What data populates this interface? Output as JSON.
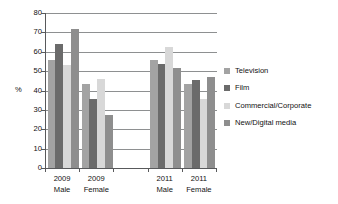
{
  "chart_data": {
    "type": "bar",
    "title": "",
    "xlabel": "",
    "ylabel": "%",
    "ylim": [
      0,
      80
    ],
    "yticks": [
      0,
      10,
      20,
      30,
      40,
      50,
      60,
      70,
      80
    ],
    "grid": true,
    "legend_position": "right",
    "categories": [
      "2009 Male",
      "2009 Female",
      "",
      "2011 Male",
      "2011 Female"
    ],
    "category_lines": [
      [
        "2009",
        "Male"
      ],
      [
        "2009",
        "Female"
      ],
      [
        "",
        ""
      ],
      [
        "2011",
        "Male"
      ],
      [
        "2011",
        "Female"
      ]
    ],
    "series": [
      {
        "name": "Television",
        "color": "#a3a3a3",
        "values": [
          56,
          43.5,
          null,
          55.5,
          43.5
        ]
      },
      {
        "name": "Film",
        "color": "#6b6b6b",
        "values": [
          64,
          35.5,
          null,
          53.5,
          45.5
        ]
      },
      {
        "name": "Commercial/Corporate",
        "color": "#d8d8d8",
        "values": [
          53,
          46,
          null,
          62.5,
          35.5
        ]
      },
      {
        "name": "New/Digital media",
        "color": "#8e8e8e",
        "values": [
          71.5,
          27.5,
          null,
          51.5,
          47
        ]
      }
    ]
  },
  "axis": {
    "y_label": "%",
    "y_ticks": [
      "80",
      "70",
      "60",
      "50",
      "40",
      "30",
      "20",
      "10",
      "0"
    ]
  },
  "legend": {
    "items": [
      {
        "label": "Television",
        "swatch": "#a3a3a3"
      },
      {
        "label": "Film",
        "swatch": "#6b6b6b"
      },
      {
        "label": "Commercial/Corporate",
        "swatch": "#d8d8d8"
      },
      {
        "label": "New/Digital media",
        "swatch": "#8e8e8e"
      }
    ]
  }
}
